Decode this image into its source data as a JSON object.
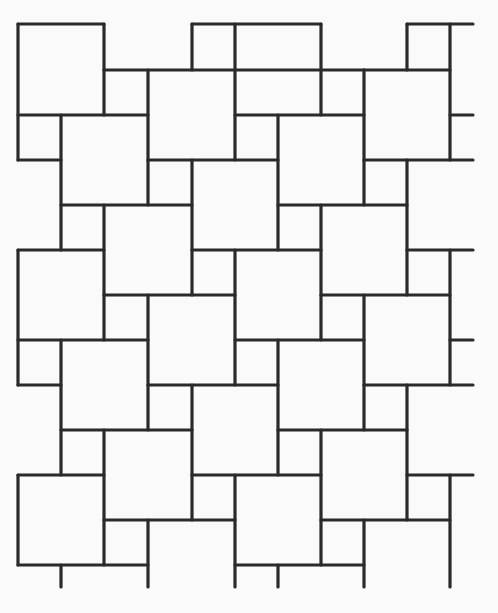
{
  "diagram": {
    "type": "tiling-pattern",
    "width": 498,
    "height": 613,
    "background": "#fafafa",
    "stroke_color": "#2a2a2a",
    "stroke_width": 3.2,
    "horizontal_segments": [
      [
        24,
        18,
        104
      ],
      [
        24,
        192,
        321
      ],
      [
        24,
        407,
        473
      ],
      [
        70,
        104,
        364
      ],
      [
        70,
        364,
        450
      ],
      [
        115,
        18,
        148
      ],
      [
        115,
        235,
        364
      ],
      [
        115,
        450,
        473
      ],
      [
        160,
        18,
        61
      ],
      [
        160,
        148,
        278
      ],
      [
        160,
        364,
        473
      ],
      [
        205,
        61,
        192
      ],
      [
        205,
        278,
        407
      ],
      [
        250,
        18,
        104
      ],
      [
        250,
        192,
        321
      ],
      [
        250,
        407,
        473
      ],
      [
        295,
        104,
        235
      ],
      [
        295,
        321,
        450
      ],
      [
        340,
        18,
        148
      ],
      [
        340,
        235,
        364
      ],
      [
        340,
        450,
        473
      ],
      [
        385,
        18,
        61
      ],
      [
        385,
        148,
        278
      ],
      [
        385,
        364,
        473
      ],
      [
        430,
        61,
        192
      ],
      [
        430,
        278,
        407
      ],
      [
        475,
        18,
        104
      ],
      [
        475,
        192,
        321
      ],
      [
        475,
        407,
        473
      ],
      [
        520,
        104,
        235
      ],
      [
        520,
        321,
        450
      ],
      [
        565,
        18,
        148
      ],
      [
        565,
        235,
        364
      ]
    ],
    "vertical_segments": [
      [
        18,
        24,
        160
      ],
      [
        18,
        250,
        385
      ],
      [
        18,
        475,
        565
      ],
      [
        61,
        115,
        250
      ],
      [
        61,
        340,
        475
      ],
      [
        61,
        565,
        587
      ],
      [
        104,
        24,
        115
      ],
      [
        104,
        205,
        340
      ],
      [
        104,
        430,
        565
      ],
      [
        148,
        70,
        205
      ],
      [
        148,
        295,
        430
      ],
      [
        148,
        520,
        587
      ],
      [
        192,
        24,
        70
      ],
      [
        192,
        160,
        295
      ],
      [
        192,
        385,
        520
      ],
      [
        235,
        24,
        160
      ],
      [
        235,
        250,
        385
      ],
      [
        235,
        475,
        587
      ],
      [
        278,
        115,
        250
      ],
      [
        278,
        340,
        475
      ],
      [
        278,
        565,
        587
      ],
      [
        321,
        24,
        115
      ],
      [
        321,
        205,
        340
      ],
      [
        321,
        430,
        565
      ],
      [
        364,
        70,
        205
      ],
      [
        364,
        295,
        430
      ],
      [
        364,
        520,
        587
      ],
      [
        407,
        24,
        70
      ],
      [
        407,
        160,
        295
      ],
      [
        407,
        385,
        520
      ],
      [
        450,
        24,
        160
      ],
      [
        450,
        250,
        385
      ],
      [
        450,
        475,
        587
      ]
    ]
  }
}
